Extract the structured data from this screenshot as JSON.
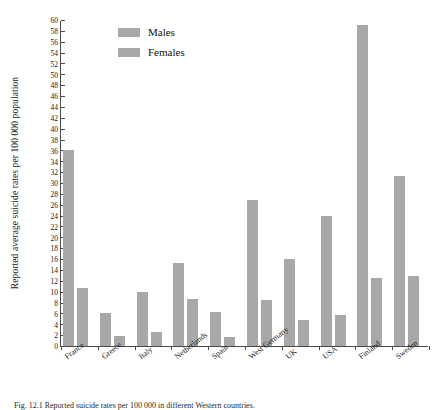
{
  "chart_data": {
    "type": "bar",
    "title": "",
    "xlabel": "",
    "ylabel": "Reported average suicide rates per 100 000 population",
    "ylim": [
      0,
      60
    ],
    "ytick_step": 2,
    "grid": false,
    "legend_position": "top-left-inside",
    "categories": [
      "France",
      "Greece",
      "Italy",
      "Netherlands",
      "Spain",
      "West Germany",
      "UK",
      "USA",
      "Finland",
      "Sweden"
    ],
    "yticks": [
      0,
      2,
      4,
      6,
      8,
      10,
      12,
      14,
      16,
      18,
      20,
      22,
      24,
      26,
      28,
      30,
      32,
      34,
      36,
      38,
      40,
      42,
      44,
      46,
      48,
      50,
      52,
      54,
      56,
      58,
      60
    ],
    "series": [
      {
        "name": "Males",
        "color": "#a8a8a8",
        "values": [
          36.0,
          6.1,
          9.9,
          15.2,
          6.2,
          26.9,
          16.0,
          24.0,
          59.0,
          31.2
        ]
      },
      {
        "name": "Females",
        "color": "#a8a8a8",
        "values": [
          10.7,
          1.8,
          2.6,
          8.7,
          1.6,
          8.4,
          4.8,
          5.7,
          12.5,
          12.8
        ]
      }
    ]
  },
  "legend": {
    "items": [
      {
        "label": "Males"
      },
      {
        "label": "Females"
      }
    ]
  },
  "caption": {
    "text": "Fig. 12.1  Reported suicide rates per 100 000 in different Western countries."
  },
  "colors": {
    "bar": "#a8a8a8",
    "axis": "#4a4a4a",
    "text": "#1a1a1a",
    "background": "#ffffff"
  }
}
